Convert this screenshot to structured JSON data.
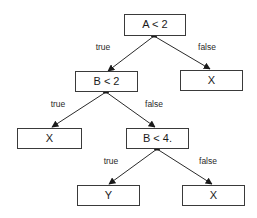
{
  "diagram": {
    "type": "decision-tree",
    "nodes": [
      {
        "id": "n1",
        "label": "A < 2",
        "kind": "decision"
      },
      {
        "id": "n2",
        "label": "B < 2",
        "kind": "decision"
      },
      {
        "id": "n3",
        "label": "X",
        "kind": "leaf"
      },
      {
        "id": "n4",
        "label": "X",
        "kind": "leaf"
      },
      {
        "id": "n5",
        "label": "B < 4.",
        "kind": "decision"
      },
      {
        "id": "n6",
        "label": "Y",
        "kind": "leaf"
      },
      {
        "id": "n7",
        "label": "X",
        "kind": "leaf"
      }
    ],
    "edges": [
      {
        "from": "n1",
        "to": "n2",
        "label": "true"
      },
      {
        "from": "n1",
        "to": "n3",
        "label": "false"
      },
      {
        "from": "n2",
        "to": "n4",
        "label": "true"
      },
      {
        "from": "n2",
        "to": "n5",
        "label": "false"
      },
      {
        "from": "n5",
        "to": "n6",
        "label": "true"
      },
      {
        "from": "n5",
        "to": "n7",
        "label": "false"
      }
    ]
  }
}
